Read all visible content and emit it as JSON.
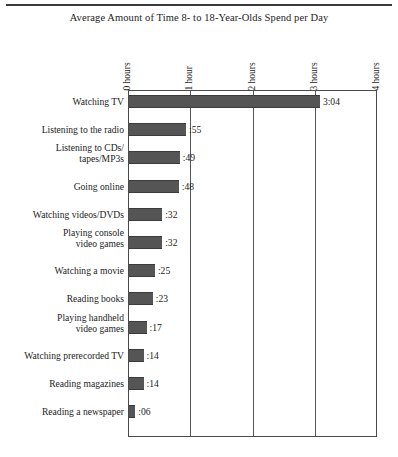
{
  "chart_data": {
    "type": "bar",
    "title": "Average Amount of Time 8- to 18-Year-Olds Spend per Day",
    "xlabel": "",
    "ylabel": "",
    "orientation": "horizontal",
    "grid": true,
    "legend": "none",
    "xlim": [
      0,
      4
    ],
    "x_unit": "hours",
    "tick_labels": [
      "0 hours",
      "1 hour",
      "2 hours",
      "3 hours",
      "4 hours"
    ],
    "tick_values": [
      0,
      1,
      2,
      3,
      4
    ],
    "categories": [
      "Watching TV",
      "Listening to the radio",
      "Listening to CDs/\ntapes/MP3s",
      "Going online",
      "Watching videos/DVDs",
      "Playing console\nvideo games",
      "Watching a movie",
      "Reading books",
      "Playing handheld\nvideo games",
      "Watching prerecorded TV",
      "Reading magazines",
      "Reading a newspaper"
    ],
    "value_labels": [
      "3:04",
      ":55",
      ":49",
      ":48",
      ":32",
      ":32",
      ":25",
      ":23",
      ":17",
      ":14",
      ":14",
      ":06"
    ],
    "values_minutes": [
      184,
      55,
      49,
      48,
      32,
      32,
      25,
      23,
      17,
      14,
      14,
      6
    ],
    "values_hours": [
      3.067,
      0.917,
      0.817,
      0.8,
      0.533,
      0.533,
      0.417,
      0.383,
      0.283,
      0.233,
      0.233,
      0.1
    ],
    "bar_color": "#555555",
    "axis_color": "#4a4a4a",
    "background_color": "#ffffff"
  }
}
